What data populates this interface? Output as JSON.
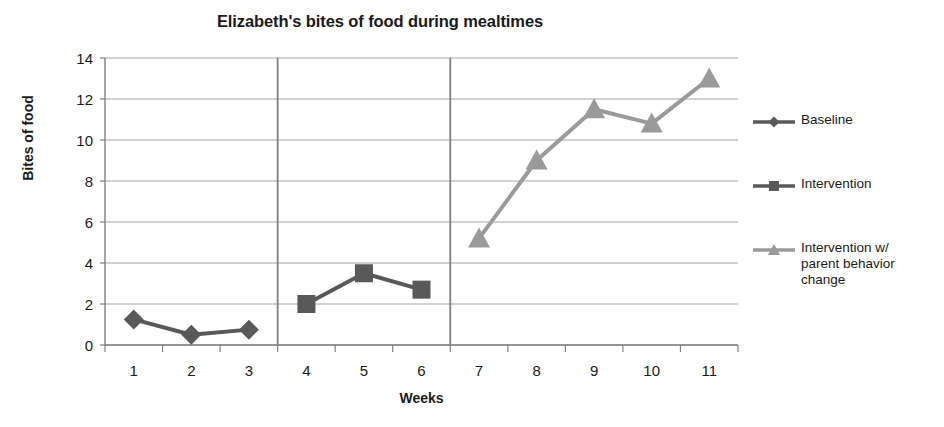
{
  "chart_data": {
    "type": "line",
    "title": "Elizabeth's bites of food during mealtimes",
    "xlabel": "Weeks",
    "ylabel": "Bites of food",
    "x": [
      1,
      2,
      3,
      4,
      5,
      6,
      7,
      8,
      9,
      10,
      11
    ],
    "xtick_labels": [
      "1",
      "2",
      "3",
      "4",
      "5",
      "6",
      "7",
      "8",
      "9",
      "10",
      "11"
    ],
    "ytick_labels": [
      "0",
      "2",
      "4",
      "6",
      "8",
      "10",
      "12",
      "14"
    ],
    "yticks": [
      0,
      2,
      4,
      6,
      8,
      10,
      12,
      14
    ],
    "ylim": [
      0,
      14
    ],
    "grid": "horizontal",
    "legend_position": "right",
    "phase_lines_after_week": [
      3,
      6
    ],
    "series": [
      {
        "name": "Baseline",
        "marker": "diamond",
        "color": "#595959",
        "x": [
          1,
          2,
          3
        ],
        "values": [
          1.25,
          0.5,
          0.75
        ]
      },
      {
        "name": "Intervention",
        "marker": "square",
        "color": "#595959",
        "x": [
          4,
          5,
          6
        ],
        "values": [
          2.0,
          3.5,
          2.7
        ]
      },
      {
        "name": "Intervention w/ parent behavior change",
        "marker": "triangle",
        "color": "#9a9a9a",
        "x": [
          7,
          8,
          9,
          10,
          11
        ],
        "values": [
          5.2,
          9.0,
          11.5,
          10.8,
          13.0
        ]
      }
    ]
  },
  "legend": {
    "items": [
      {
        "label": "Baseline",
        "marker": "diamond",
        "color": "#595959"
      },
      {
        "label": "Intervention",
        "marker": "square",
        "color": "#595959"
      },
      {
        "label": "Intervention w/\nparent behavior\nchange",
        "marker": "triangle",
        "color": "#9a9a9a"
      }
    ]
  },
  "colors": {
    "axis": "#808080",
    "gridline": "#a6a6a6",
    "phase_line": "#7f7f7f",
    "text": "#1a1a1a",
    "background": "#ffffff",
    "series_dark": "#595959",
    "series_light": "#9a9a9a"
  }
}
